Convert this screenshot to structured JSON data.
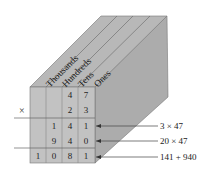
{
  "diagram": {
    "type": "place-value-box",
    "columns": [
      "Thousands",
      "Hundreds",
      "Tens",
      "Ones"
    ],
    "operator": "×",
    "rows": [
      {
        "id": "multiplicand",
        "digits": [
          "",
          "",
          "4",
          "7"
        ]
      },
      {
        "id": "multiplier",
        "digits": [
          "",
          "",
          "2",
          "3"
        ]
      },
      {
        "id": "partial-1",
        "digits": [
          "",
          "1",
          "4",
          "1"
        ],
        "annotation": "3 × 47"
      },
      {
        "id": "partial-2",
        "digits": [
          "",
          "9",
          "4",
          "0"
        ],
        "annotation": "20 × 47"
      },
      {
        "id": "sum",
        "digits": [
          "1",
          "0",
          "8",
          "1"
        ],
        "annotation": "141 + 940"
      }
    ],
    "colors": {
      "front_face": "#bdbdbd",
      "top_face": "#b3b3b3",
      "side_face": "#a9a9a9",
      "lines": "#555555"
    }
  }
}
